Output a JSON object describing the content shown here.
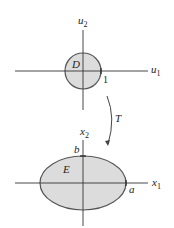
{
  "top_diagram": {
    "region_label": "D",
    "vertical_axis": {
      "name": "u",
      "sub": "2"
    },
    "horizontal_axis": {
      "name": "u",
      "sub": "1"
    },
    "radius_label": "1"
  },
  "transform": {
    "label": "T"
  },
  "bottom_diagram": {
    "region_label": "E",
    "vertical_axis": {
      "name": "x",
      "sub": "2"
    },
    "horizontal_axis": {
      "name": "x",
      "sub": "1"
    },
    "semi_major_label": "a",
    "semi_minor_label": "b"
  },
  "colors": {
    "fill": "#dcdcdc",
    "stroke": "#555555",
    "axis": "#333333"
  }
}
